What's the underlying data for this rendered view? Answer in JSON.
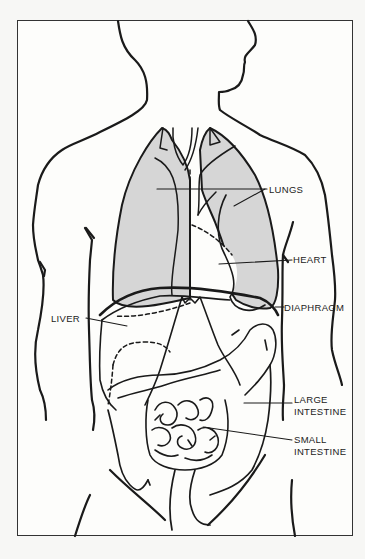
{
  "diagram": {
    "type": "anatomical-illustration",
    "colors": {
      "outline": "#1a1a1a",
      "lung_fill": "#d6d6d6",
      "background": "#fdfdfb",
      "frame": "#333333"
    },
    "labels": {
      "lungs": "LUNGS",
      "heart": "HEART",
      "diaphragm": "DIAPHRAGM",
      "liver": "LIVER",
      "large_intestine_1": "LARGE",
      "large_intestine_2": "INTESTINE",
      "small_intestine_1": "SMALL",
      "small_intestine_2": "INTESTINE"
    }
  }
}
